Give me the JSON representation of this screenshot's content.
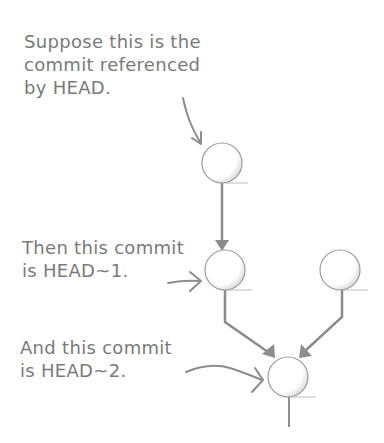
{
  "diagram": {
    "type": "git-commit-graph",
    "colors": {
      "text": "#7a7a7a",
      "line": "#8c8c8c",
      "circle_stroke": "#9a9a9a",
      "circle_shade": "#d0d0d0",
      "background": "#ffffff"
    },
    "annotations": [
      {
        "id": "head",
        "lines": [
          "Suppose this is the",
          "commit referenced",
          "by HEAD."
        ],
        "points_to": "commit-head"
      },
      {
        "id": "head-1",
        "lines": [
          "Then this commit",
          "is HEAD~1."
        ],
        "points_to": "commit-head-1"
      },
      {
        "id": "head-2",
        "lines": [
          "And this commit",
          "is HEAD~2."
        ],
        "points_to": "commit-head-2"
      }
    ],
    "nodes": [
      {
        "id": "commit-head",
        "label": "HEAD",
        "cx": 222,
        "cy": 163
      },
      {
        "id": "commit-head-1",
        "label": "HEAD~1",
        "cx": 225,
        "cy": 270
      },
      {
        "id": "commit-side",
        "label": "",
        "cx": 340,
        "cy": 270
      },
      {
        "id": "commit-head-2",
        "label": "HEAD~2",
        "cx": 288,
        "cy": 377
      }
    ],
    "edges": [
      {
        "from": "commit-head",
        "to": "commit-head-1"
      },
      {
        "from": "commit-head-1",
        "to": "commit-head-2"
      },
      {
        "from": "commit-side",
        "to": "commit-head-2"
      }
    ]
  }
}
